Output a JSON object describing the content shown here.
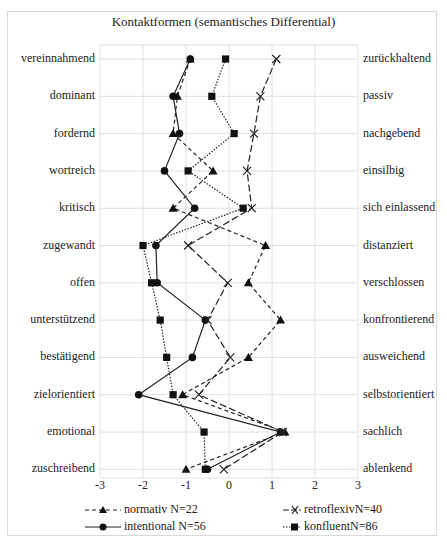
{
  "chart_data": {
    "type": "line",
    "title": "Kontaktformen (semantisches Differential)",
    "orientation": "horizontal-profile",
    "xlim": [
      -3,
      3
    ],
    "x_ticks": [
      "-3",
      "-2",
      "-1",
      "0",
      "1",
      "2",
      "3"
    ],
    "grid": true,
    "legend_position": "bottom",
    "left_labels": [
      "vereinnahmend",
      "dominant",
      "fordernd",
      "wortreich",
      "kritisch",
      "zugewandt",
      "offen",
      "unterstützend",
      "bestätigend",
      "zielorientiert",
      "emotional",
      "zuschreibend"
    ],
    "right_labels": [
      "zurückhaltend",
      "passiv",
      "nachgebend",
      "einsilbig",
      "sich einlassend",
      "distanziert",
      "verschlossen",
      "konfrontierend",
      "ausweichend",
      "selbstorientiert",
      "sachlich",
      "ablenkend"
    ],
    "series": [
      {
        "name": "normativ N=22",
        "marker": "triangle",
        "line": "dashed",
        "values": [
          -0.9,
          -1.2,
          -1.3,
          -0.37,
          -1.3,
          0.85,
          0.45,
          1.2,
          0.45,
          -1.08,
          1.3,
          -1.0
        ]
      },
      {
        "name": "intentional N=56",
        "marker": "circle",
        "line": "solid",
        "values": [
          -0.9,
          -1.3,
          -1.15,
          -1.5,
          -0.8,
          -1.7,
          -1.67,
          -0.55,
          -0.85,
          -2.1,
          1.2,
          -0.5
        ]
      },
      {
        "name": "retroflexivN=40",
        "marker": "x",
        "line": "longdash",
        "values": [
          1.1,
          0.73,
          0.58,
          0.42,
          0.53,
          -0.95,
          -0.03,
          -0.5,
          0.03,
          -0.7,
          1.25,
          -0.12
        ]
      },
      {
        "name": "konfluentN=86",
        "marker": "square",
        "line": "dotted",
        "values": [
          -0.08,
          -0.4,
          0.12,
          -0.95,
          0.33,
          -2.0,
          -1.8,
          -1.6,
          -1.45,
          -1.3,
          -0.58,
          -0.55
        ]
      }
    ]
  }
}
